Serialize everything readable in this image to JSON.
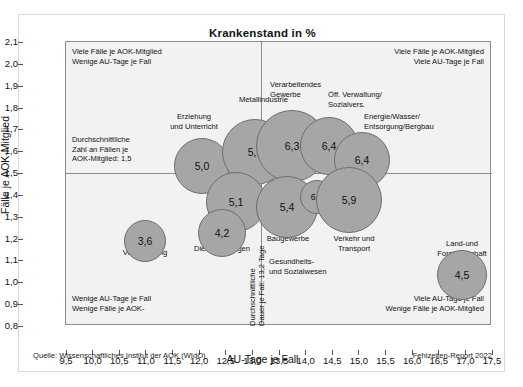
{
  "figure": {
    "title": "Krankenstand in %",
    "source": "Quelle: Wissenschaftliches Institut der AOK (WIdO)",
    "report": "Fehlzeiten-Report 2022"
  },
  "axes": {
    "xlabel": "AU-Tage je Fall",
    "ylabel": "Fälle je AOK-Mitglied",
    "xticks": [
      "9,5",
      "10,0",
      "10,5",
      "11,0",
      "11,5",
      "12,0",
      "12,5",
      "13,0",
      "13,5",
      "14,0",
      "14,5",
      "15,0",
      "15,5",
      "16,0",
      "16,5",
      "17,0",
      "17,5"
    ],
    "yticks": [
      "2,1",
      "2,0",
      "1,9",
      "1,8",
      "1,7",
      "1,6",
      "1,5",
      "1,4",
      "1,3",
      "1,2",
      "1,1",
      "1,0",
      "0,9",
      "0,8"
    ]
  },
  "annotations": {
    "top_left": "Viele Fälle je AOK-Mitglied\nWenige AU-Tage je Fall",
    "top_right": "Viele Fälle je AOK-Mitglied\nViele AU-Tage je Fall",
    "bottom_left": "Wenige AU-Tage je Fall\nWenige Fälle je AOK-",
    "bottom_right": "Viele AU-Tage je Fall\nWenige Fälle je AOK-Mitglied",
    "mean_y": "Durchschnittliche\nZahl an Fällen je\nAOK-Mitglied: 1,5",
    "mean_x": "Durchschnittliche\nDauer je Fall: 13,2 Tage"
  },
  "chart_data": {
    "type": "scatter",
    "title": "Krankenstand in %",
    "xlabel": "AU-Tage je Fall",
    "ylabel": "Fälle je AOK-Mitglied",
    "xlim": [
      9.5,
      17.5
    ],
    "ylim": [
      0.8,
      2.1
    ],
    "grid": false,
    "legend": "none",
    "bubble_value_meaning": "Krankenstand in % (bubble label and size)",
    "reference_lines": {
      "mean_faelle_je_mitglied": 1.5,
      "mean_dauer_je_fall_tage": 13.2
    },
    "points": [
      {
        "label": "Erziehung und Unterricht",
        "x": 12.0,
        "y": 1.6,
        "value": 5.0,
        "value_text": "5,0"
      },
      {
        "label": "Metallindustrie",
        "x": 12.9,
        "y": 1.68,
        "value": 5.9,
        "value_text": "5,9"
      },
      {
        "label": "Verarbeitendes Gewerbe",
        "x": 13.6,
        "y": 1.7,
        "value": 6.3,
        "value_text": "6,3"
      },
      {
        "label": "Öff. Verwaltung/Sozialvers.",
        "x": 14.2,
        "y": 1.68,
        "value": 6.4,
        "value_text": "6,4"
      },
      {
        "label": "Energie/Wasser/Entsorgung/Bergbau",
        "x": 14.6,
        "y": 1.6,
        "value": 6.4,
        "value_text": "6,4"
      },
      {
        "label": "Handel",
        "x": 12.6,
        "y": 1.47,
        "value": 5.1,
        "value_text": "5,1"
      },
      {
        "label": "Baugewerbe",
        "x": 13.4,
        "y": 1.45,
        "value": 5.4,
        "value_text": "5,4"
      },
      {
        "label": "Gesundheits- und Sozialwesen",
        "x": 13.7,
        "y": 1.48,
        "value": 6.2,
        "value_text": "6,2"
      },
      {
        "label": "Verkehr und Transport",
        "x": 14.3,
        "y": 1.45,
        "value": 5.9,
        "value_text": "5,9"
      },
      {
        "label": "Dienstleistungen",
        "x": 12.4,
        "y": 1.3,
        "value": 4.2,
        "value_text": "4,2"
      },
      {
        "label": "Banken/Versicherung",
        "x": 11.1,
        "y": 1.19,
        "value": 3.6,
        "value_text": "3,6"
      },
      {
        "label": "Land- und Forstwirtschaft",
        "x": 16.6,
        "y": 1.02,
        "value": 4.5,
        "value_text": "4,5"
      }
    ]
  },
  "bubble_labels": {
    "erziehung": "Erziehung\nund Unterricht",
    "metall": "Metallindustrie",
    "verarbeitendes": "Verarbeitendes\nGewerbe",
    "oeff": "Öff. Verwaltung/\nSozialvers.",
    "energie": "Energie/Wasser/\nEntsorgung/Bergbau",
    "handel": "Handel",
    "bau": "Baugewerbe",
    "gesundheit": "Gesundheits-\nund Sozialwesen",
    "verkehr": "Verkehr und\nTransport",
    "dienst": "Dienstleistungen",
    "banken": "Banken/\nVersicherung",
    "land": "Land-und\nForstwirtschaft"
  },
  "bubble_values": {
    "erziehung": "5,0",
    "metall": "5,9",
    "verarbeitendes": "6,3",
    "oeff": "6,4",
    "energie": "6,4",
    "handel": "5,1",
    "bau": "5,4",
    "gesundheit": "6,2",
    "verkehr": "5,9",
    "dienst": "4,2",
    "banken": "3,6",
    "land": "4,5"
  }
}
